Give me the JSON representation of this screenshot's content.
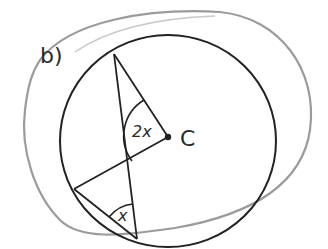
{
  "part_label": "b)",
  "center_label": "C",
  "angle_at_center": "2x",
  "angle_at_circumference": "x",
  "colors": {
    "ink": "#222222",
    "highlight_loop": "#8a8a8a",
    "background": "#ffffff"
  },
  "figure": {
    "circle": {
      "cx": 168,
      "cy": 141,
      "r": 107
    },
    "points": {
      "top": [
        114,
        54
      ],
      "center": [
        168,
        137
      ],
      "left": [
        74,
        189
      ],
      "bottom": [
        137,
        239
      ]
    }
  }
}
